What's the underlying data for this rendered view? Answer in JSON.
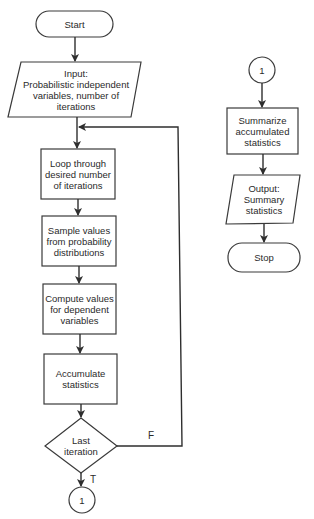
{
  "diagram": {
    "type": "flowchart",
    "main_flow": {
      "start": "Start",
      "input": "Input: Probabilistic independent variables, number of iterations",
      "input_lines": [
        "Input:",
        "Probabilistic independent",
        "variables, number of",
        "iterations"
      ],
      "loop": "Loop through desired number of iterations",
      "sample": "Sample values from probability distributions",
      "compute": "Compute values for dependent variables",
      "accumulate": "Accumulate statistics",
      "decision": "Last iteration",
      "branch_false": "F",
      "branch_true": "T",
      "connector_out": "1"
    },
    "secondary_flow": {
      "connector_in": "1",
      "summarize": "Summarize accumulated statistics",
      "output": "Output: Summary statistics",
      "stop": "Stop"
    },
    "edges": [
      {
        "from": "Start",
        "to": "Input"
      },
      {
        "from": "Input",
        "to": "Loop through desired number of iterations"
      },
      {
        "from": "Loop through desired number of iterations",
        "to": "Sample values from probability distributions"
      },
      {
        "from": "Sample values from probability distributions",
        "to": "Compute values for dependent variables"
      },
      {
        "from": "Compute values for dependent variables",
        "to": "Accumulate statistics"
      },
      {
        "from": "Accumulate statistics",
        "to": "Last iteration"
      },
      {
        "from": "Last iteration",
        "to": "Loop through desired number of iterations",
        "label": "F"
      },
      {
        "from": "Last iteration",
        "to": "1",
        "label": "T"
      },
      {
        "from": "1",
        "to": "Summarize accumulated statistics"
      },
      {
        "from": "Summarize accumulated statistics",
        "to": "Output: Summary statistics"
      },
      {
        "from": "Output: Summary statistics",
        "to": "Stop"
      }
    ]
  }
}
